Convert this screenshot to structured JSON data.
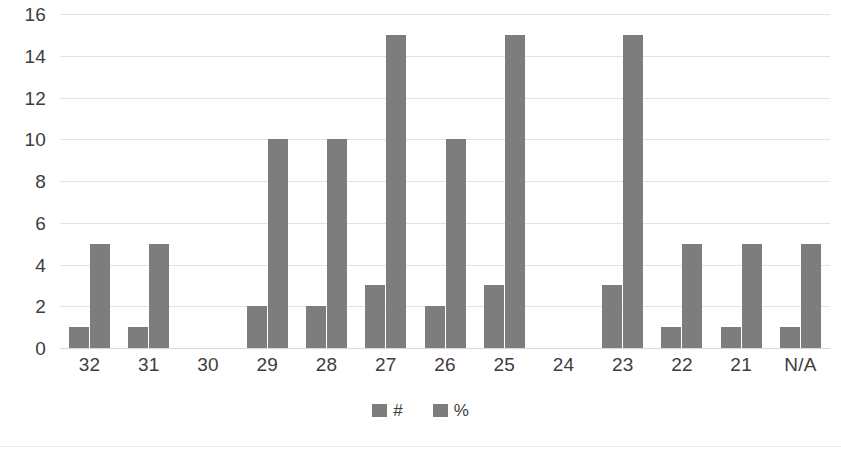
{
  "chart_data": {
    "type": "bar",
    "title": "",
    "subtitle": "",
    "xlabel": "",
    "ylabel": "",
    "ylim": [
      0,
      16
    ],
    "y_ticks": [
      0,
      2,
      4,
      6,
      8,
      10,
      12,
      14,
      16
    ],
    "grid": true,
    "legend_position": "bottom",
    "categories": [
      "32",
      "31",
      "30",
      "29",
      "28",
      "27",
      "26",
      "25",
      "24",
      "23",
      "22",
      "21",
      "N/A"
    ],
    "series": [
      {
        "name": "#",
        "values": [
          1,
          1,
          0,
          2,
          2,
          3,
          2,
          3,
          0,
          3,
          1,
          1,
          1
        ]
      },
      {
        "name": "%",
        "values": [
          5,
          5,
          0,
          10,
          10,
          15,
          10,
          15,
          0,
          15,
          5,
          5,
          5
        ]
      }
    ],
    "colors": {
      "series_num": "#7d7d7d",
      "series_pct": "#7d7d7d",
      "gridline": "#e2e2e2",
      "axis_text": "#3d3d3d",
      "background": "#ffffff"
    }
  },
  "legend": {
    "items": [
      {
        "label": "#"
      },
      {
        "label": "%"
      }
    ]
  }
}
